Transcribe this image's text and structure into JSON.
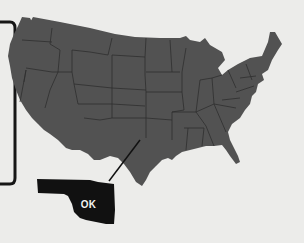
{
  "map": {
    "subject": "United States (contiguous)",
    "highlighted_state": {
      "name": "Oklahoma",
      "label": "OK"
    },
    "colors": {
      "background": "#ececea",
      "states_fill": "#525252",
      "state_borders": "#2e2e2e",
      "highlight_fill": "#111111",
      "label_text": "#f4f4f2",
      "bracket": "#161616"
    }
  }
}
